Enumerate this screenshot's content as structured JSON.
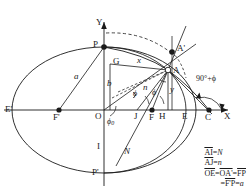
{
  "figure": {
    "type": "geometric-diagram",
    "axes": {
      "x_label": "X",
      "y_label": "Y"
    },
    "points": [
      {
        "id": "Eprime",
        "label": "E'",
        "x": 12,
        "y": 110,
        "marker": "none"
      },
      {
        "id": "Fprime",
        "label": "F'",
        "x": 59,
        "y": 110,
        "marker": "dot"
      },
      {
        "id": "O",
        "label": "O",
        "x": 104,
        "y": 110,
        "marker": "none"
      },
      {
        "id": "J",
        "label": "J",
        "x": 137,
        "y": 110,
        "marker": "none"
      },
      {
        "id": "F",
        "label": "F",
        "x": 152,
        "y": 110,
        "marker": "dot"
      },
      {
        "id": "H",
        "label": "H",
        "x": 164,
        "y": 110,
        "marker": "none"
      },
      {
        "id": "E",
        "label": "E",
        "x": 186,
        "y": 110,
        "marker": "none"
      },
      {
        "id": "C",
        "label": "C",
        "x": 209,
        "y": 110,
        "marker": "dot"
      },
      {
        "id": "P",
        "label": "P",
        "x": 104,
        "y": 47,
        "marker": "dot"
      },
      {
        "id": "Pprime",
        "label": "P'",
        "x": 104,
        "y": 175,
        "marker": "none"
      },
      {
        "id": "A",
        "label": "A",
        "x": 168,
        "y": 70,
        "marker": "circle"
      },
      {
        "id": "Aprime",
        "label": "A'",
        "x": 172,
        "y": 52,
        "marker": "dot"
      },
      {
        "id": "G",
        "label": "G",
        "x": 110,
        "y": 64,
        "marker": "none"
      },
      {
        "id": "I",
        "label": "I",
        "x": 104,
        "y": 148,
        "marker": "none"
      },
      {
        "id": "N",
        "label": "N",
        "x": 126,
        "y": 152,
        "marker": "none"
      }
    ],
    "segment_labels": [
      {
        "id": "a",
        "text": "a"
      },
      {
        "id": "b",
        "text": "b"
      },
      {
        "id": "x",
        "text": "x"
      },
      {
        "id": "y",
        "text": "y"
      },
      {
        "id": "n",
        "text": "n"
      }
    ],
    "angle_labels": [
      {
        "id": "phi0",
        "text": "ϕ",
        "sub": "0"
      },
      {
        "id": "phi1",
        "text": "ϕ"
      },
      {
        "id": "phi2",
        "text": "ϕ"
      },
      {
        "id": "exterior",
        "text": "90°+ϕ"
      }
    ],
    "legend": {
      "lines": [
        {
          "id": "AI",
          "lhs": "AI",
          "rel": "=",
          "rhs": "N"
        },
        {
          "id": "AJ",
          "lhs": "AJ",
          "rel": "=",
          "rhs": "n"
        },
        {
          "id": "OE",
          "parts": [
            "OE",
            "=",
            "OA'",
            "=",
            "FP"
          ]
        },
        {
          "id": "FP",
          "parts": [
            "=",
            "F'P",
            "=",
            "a"
          ]
        }
      ]
    },
    "colors": {
      "stroke": "#1a1a1a",
      "fill": "#ffffff"
    }
  }
}
